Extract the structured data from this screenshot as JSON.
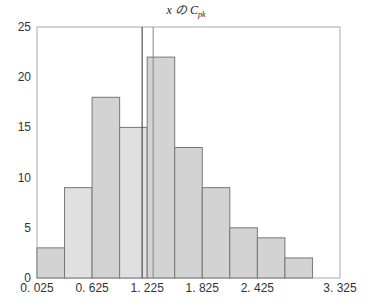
{
  "chart_data": {
    "type": "bar",
    "title_parts": {
      "var": "x",
      "particle": "の",
      "main": "C",
      "sub": "pk"
    },
    "xlabel": "",
    "ylabel": "",
    "bin_edges": [
      0.025,
      0.325,
      0.625,
      0.925,
      1.225,
      1.525,
      1.825,
      2.125,
      2.425,
      2.725,
      3.025,
      3.325
    ],
    "categories": [
      "0.025-0.325",
      "0.325-0.625",
      "0.625-0.925",
      "0.925-1.225",
      "1.225-1.525",
      "1.525-1.825",
      "1.825-2.125",
      "2.125-2.425",
      "2.425-2.725",
      "2.725-3.025",
      "3.025-3.325"
    ],
    "values": [
      3,
      9,
      18,
      15,
      22,
      13,
      9,
      5,
      4,
      2,
      0
    ],
    "xlim": [
      0.025,
      3.325
    ],
    "ylim": [
      0,
      25
    ],
    "x_ticks": [
      "0. 025",
      "0. 625",
      "1. 225",
      "1. 825",
      "2. 425",
      "3. 325"
    ],
    "y_ticks": [
      "0",
      "5",
      "10",
      "15",
      "20",
      "25"
    ],
    "reference_lines": [
      {
        "x": 1.17,
        "color": "#333333"
      },
      {
        "x": 1.29,
        "color": "#888888"
      }
    ],
    "grid": false,
    "bar_color": "#d3d3d3",
    "bar_edge": "#777777"
  }
}
